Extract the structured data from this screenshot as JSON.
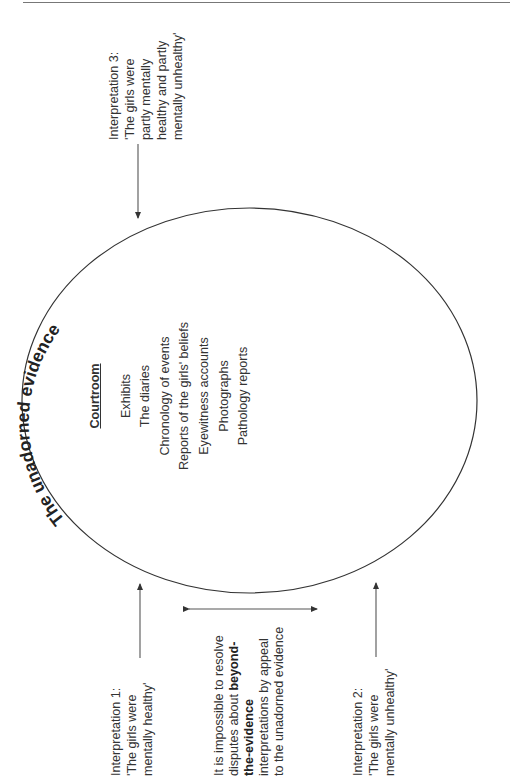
{
  "diagram": {
    "title": "The unadorned evidence",
    "circle": {
      "heading": "Courtroom",
      "items": [
        "Exhibits",
        "The diaries",
        "Chronology of events",
        "Reports of the girls' beliefs",
        "Eyewitness accounts",
        "Photographs",
        "Pathology reports"
      ]
    },
    "interpretation_1": {
      "label": "Interpretation 1:",
      "lines": [
        "'The girls were",
        "mentally healthy'"
      ]
    },
    "interpretation_2": {
      "label": "Interpretation 2:",
      "lines": [
        "'The girls were",
        "mentally unhealthy'"
      ]
    },
    "interpretation_3": {
      "label": "Interpretation 3:",
      "lines": [
        "'The girls were",
        "partly mentally",
        "healthy and partly",
        "mentally unhealthy'"
      ]
    },
    "note": {
      "line1": "It is impossible to resolve",
      "line2_pre": "disputes about ",
      "line2_bold": "beyond-",
      "line3_bold": "the-evidence",
      "line4": "interpretations by appeal",
      "line5": "to the unadorned evidence"
    },
    "colors": {
      "stroke": "#333333",
      "text": "#333333",
      "rule": "#777777"
    }
  }
}
